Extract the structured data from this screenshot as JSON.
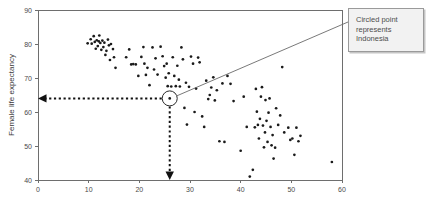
{
  "chart_data": {
    "type": "scatter",
    "title": "",
    "xlabel": "",
    "ylabel": "Female life expectancy",
    "xlim": [
      0,
      60
    ],
    "ylim": [
      40,
      90
    ],
    "xticks": [
      0,
      10,
      20,
      30,
      40,
      50,
      60
    ],
    "yticks": [
      40,
      50,
      60,
      70,
      80,
      90
    ],
    "grid": false,
    "legend": null,
    "points": [
      [
        9.8,
        80.2
      ],
      [
        10.4,
        81.4
      ],
      [
        10.6,
        80.1
      ],
      [
        11.0,
        82.3
      ],
      [
        11.2,
        80.6
      ],
      [
        11.4,
        78.6
      ],
      [
        11.6,
        81.1
      ],
      [
        11.8,
        79.4
      ],
      [
        12.0,
        80.8
      ],
      [
        12.1,
        82.5
      ],
      [
        12.3,
        80.3
      ],
      [
        12.5,
        78.3
      ],
      [
        12.7,
        81.0
      ],
      [
        12.9,
        79.1
      ],
      [
        13.1,
        80.4
      ],
      [
        13.3,
        76.8
      ],
      [
        13.5,
        78.0
      ],
      [
        13.8,
        81.3
      ],
      [
        14.0,
        79.6
      ],
      [
        14.2,
        75.3
      ],
      [
        14.4,
        80.0
      ],
      [
        14.8,
        78.5
      ],
      [
        15.0,
        76.1
      ],
      [
        15.3,
        73.0
      ],
      [
        17.4,
        76.1
      ],
      [
        18.0,
        78.4
      ],
      [
        18.4,
        74.0
      ],
      [
        18.8,
        74.1
      ],
      [
        19.3,
        74.0
      ],
      [
        19.8,
        70.6
      ],
      [
        20.4,
        76.2
      ],
      [
        20.8,
        79.1
      ],
      [
        21.0,
        74.2
      ],
      [
        21.3,
        70.9
      ],
      [
        21.6,
        73.0
      ],
      [
        22.0,
        67.9
      ],
      [
        22.6,
        79.0
      ],
      [
        22.9,
        72.5
      ],
      [
        23.2,
        75.8
      ],
      [
        23.6,
        71.0
      ],
      [
        24.2,
        79.2
      ],
      [
        24.6,
        76.4
      ],
      [
        24.9,
        73.5
      ],
      [
        25.2,
        70.1
      ],
      [
        25.4,
        74.2
      ],
      [
        25.6,
        67.6
      ],
      [
        25.8,
        71.4
      ],
      [
        26.0,
        64.0
      ],
      [
        26.3,
        67.5
      ],
      [
        26.6,
        76.1
      ],
      [
        26.9,
        70.6
      ],
      [
        27.2,
        67.6
      ],
      [
        27.5,
        73.6
      ],
      [
        27.8,
        69.5
      ],
      [
        28.0,
        67.5
      ],
      [
        28.3,
        79.0
      ],
      [
        28.6,
        75.5
      ],
      [
        28.9,
        61.2
      ],
      [
        29.2,
        68.6
      ],
      [
        29.4,
        56.3
      ],
      [
        29.8,
        67.4
      ],
      [
        30.2,
        76.3
      ],
      [
        30.6,
        74.2
      ],
      [
        30.9,
        60.0
      ],
      [
        31.2,
        66.9
      ],
      [
        31.6,
        76.0
      ],
      [
        31.9,
        74.6
      ],
      [
        32.4,
        58.7
      ],
      [
        32.8,
        55.6
      ],
      [
        33.2,
        69.2
      ],
      [
        33.6,
        63.8
      ],
      [
        33.9,
        65.0
      ],
      [
        34.2,
        67.2
      ],
      [
        34.6,
        70.2
      ],
      [
        34.9,
        63.4
      ],
      [
        35.3,
        66.4
      ],
      [
        35.8,
        51.4
      ],
      [
        36.4,
        68.4
      ],
      [
        36.8,
        51.2
      ],
      [
        37.4,
        70.6
      ],
      [
        38.0,
        68.3
      ],
      [
        38.6,
        63.2
      ],
      [
        40.0,
        48.6
      ],
      [
        40.6,
        64.5
      ],
      [
        41.2,
        55.6
      ],
      [
        41.8,
        41.0
      ],
      [
        42.4,
        43.0
      ],
      [
        42.8,
        55.5
      ],
      [
        43.0,
        66.8
      ],
      [
        43.2,
        60.1
      ],
      [
        43.4,
        56.2
      ],
      [
        43.6,
        52.2
      ],
      [
        43.8,
        58.0
      ],
      [
        44.0,
        64.5
      ],
      [
        44.2,
        67.3
      ],
      [
        44.4,
        56.0
      ],
      [
        44.6,
        49.6
      ],
      [
        44.8,
        54.0
      ],
      [
        44.9,
        63.5
      ],
      [
        45.1,
        57.4
      ],
      [
        45.3,
        51.2
      ],
      [
        45.5,
        59.8
      ],
      [
        45.7,
        64.0
      ],
      [
        45.9,
        55.6
      ],
      [
        46.1,
        50.2
      ],
      [
        46.3,
        53.2
      ],
      [
        46.5,
        46.3
      ],
      [
        46.8,
        49.5
      ],
      [
        47.0,
        61.1
      ],
      [
        47.4,
        56.2
      ],
      [
        47.8,
        59.0
      ],
      [
        48.2,
        73.2
      ],
      [
        48.6,
        54.0
      ],
      [
        49.4,
        55.4
      ],
      [
        49.8,
        51.8
      ],
      [
        50.2,
        52.2
      ],
      [
        50.6,
        47.4
      ],
      [
        51.0,
        55.4
      ],
      [
        51.4,
        51.4
      ],
      [
        51.8,
        53.0
      ],
      [
        58.0,
        45.3
      ]
    ],
    "highlight": {
      "label": "Indonesia",
      "x": 26.0,
      "y": 64.0,
      "circled": true
    },
    "guides": [
      {
        "name": "horizontal-guide-to-y-axis",
        "from": [
          26.0,
          64.0
        ],
        "to": [
          0,
          64.0
        ],
        "style": "dotted-arrow"
      },
      {
        "name": "vertical-guide-to-x-axis",
        "from": [
          26.0,
          64.0
        ],
        "to": [
          26.0,
          40.0
        ],
        "style": "dotted-arrow"
      }
    ]
  },
  "axes": {
    "y_title": "Female life expectancy",
    "x_tick_labels": [
      "0",
      "10",
      "20",
      "30",
      "40",
      "50",
      "60"
    ],
    "y_tick_labels": [
      "40",
      "50",
      "60",
      "70",
      "80",
      "90"
    ]
  },
  "callout": {
    "text": "Circled point\nrepresents\nIndonesia",
    "line1": "Circled point",
    "line2": "represents",
    "line3": "Indonesia"
  },
  "colors": {
    "point": "#1a1a1a",
    "axis": "#6e6e6e",
    "guide": "#111111",
    "callout_bg": "#f2f2f2",
    "callout_border": "#9a9a9a",
    "leader": "#6a6a6a"
  }
}
